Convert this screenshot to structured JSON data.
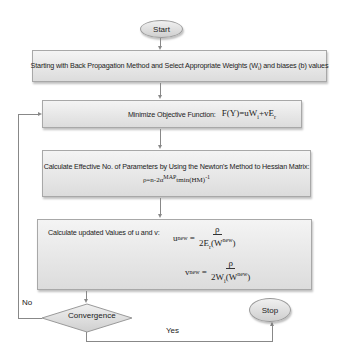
{
  "flowchart": {
    "start": {
      "label": "Start"
    },
    "step1": {
      "text": "Starting with Back Propagation Method and Select Appropriate Weights (W",
      "sub": "i",
      "text_after": ") and biases (b) values"
    },
    "step2": {
      "text": "Minimize Objective Function:",
      "formula_lhs": "F(Y)=uW",
      "formula_sub1": "i",
      "formula_mid": "+vE",
      "formula_sub2": "r"
    },
    "step3": {
      "text": "Calculate Effective No. of Parameters by Using the Newton's Method to Hessian Matrix:",
      "formula_pre": "ρ=n-2α",
      "formula_sup1": "MAP",
      "formula_post": "tmin(HM)",
      "formula_sup2": "-1"
    },
    "step4": {
      "text": "Calculate updated Values of u and v:",
      "u_lhs": "u",
      "u_sup": "new",
      "u_num": "ρ",
      "u_den_pre": "2E",
      "u_den_sub": "r",
      "u_den_post": "(W",
      "u_den_sup": "new",
      "u_den_close": ")",
      "v_lhs": "v",
      "v_sup": "new",
      "v_num": "ρ",
      "v_den_pre": "2W",
      "v_den_sub": "i",
      "v_den_post": "(W",
      "v_den_sup": "new",
      "v_den_close": ")"
    },
    "decision": {
      "label": "Convergence"
    },
    "stop": {
      "label": "Stop"
    },
    "edge_no": "No",
    "edge_yes": "Yes"
  }
}
